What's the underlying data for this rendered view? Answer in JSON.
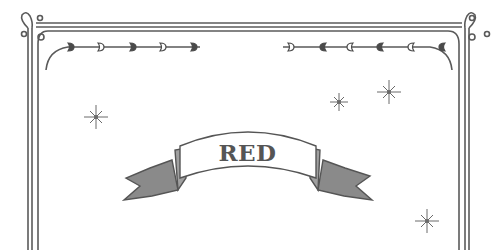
{
  "banner": {
    "label": "RED"
  },
  "colors": {
    "ink": "#555555",
    "background": "#ffffff"
  },
  "decorations": {
    "frame": "double-line-ornamental-border",
    "hearts_left": [
      "filled",
      "outline",
      "filled",
      "outline",
      "filled"
    ],
    "hearts_right": [
      "outline",
      "filled",
      "outline",
      "filled",
      "outline",
      "filled"
    ],
    "sparkles": [
      {
        "x": 96,
        "y": 117,
        "size": 12
      },
      {
        "x": 339,
        "y": 102,
        "size": 9
      },
      {
        "x": 389,
        "y": 92,
        "size": 12
      },
      {
        "x": 427,
        "y": 221,
        "size": 12
      }
    ]
  }
}
